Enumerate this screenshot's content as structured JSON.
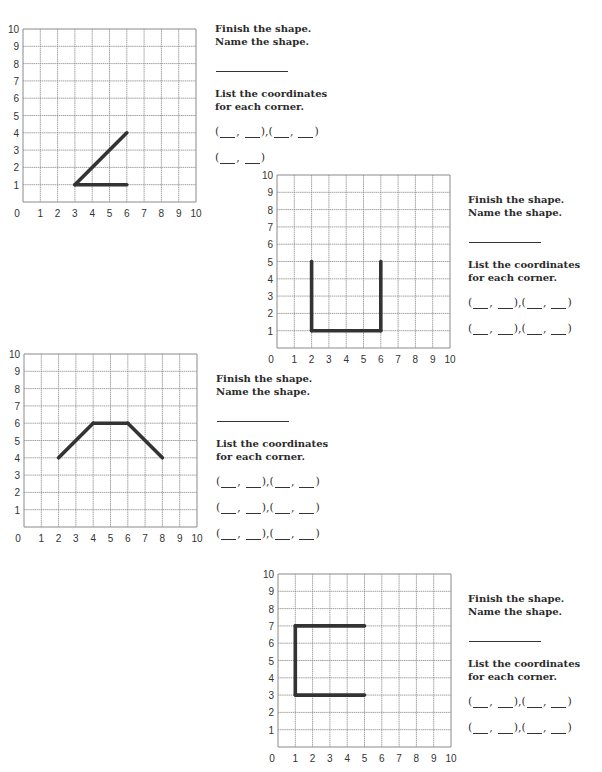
{
  "worksheet": {
    "problems": [
      {
        "id": "problem-1",
        "instructions": {
          "finish": "Finish the shape.",
          "name": "Name the shape.",
          "list_line1": "List the coordinates",
          "list_line2": "for each corner."
        },
        "coordinate_pairs_rows": [
          2,
          1
        ],
        "grid": {
          "x_ticks": [
            "0",
            "1",
            "2",
            "3",
            "4",
            "5",
            "6",
            "7",
            "8",
            "9",
            "10"
          ],
          "y_ticks": [
            "1",
            "2",
            "3",
            "4",
            "5",
            "6",
            "7",
            "8",
            "9",
            "10"
          ]
        },
        "drawn_segments": [
          [
            [
              3,
              1
            ],
            [
              6,
              4
            ]
          ],
          [
            [
              3,
              1
            ],
            [
              6,
              1
            ]
          ]
        ]
      },
      {
        "id": "problem-2",
        "instructions": {
          "finish": "Finish the shape.",
          "name": "Name the shape.",
          "list_line1": "List the coordinates",
          "list_line2": "for each corner."
        },
        "coordinate_pairs_rows": [
          2,
          2
        ],
        "grid": {
          "x_ticks": [
            "0",
            "1",
            "2",
            "3",
            "4",
            "5",
            "6",
            "7",
            "8",
            "9",
            "10"
          ],
          "y_ticks": [
            "1",
            "2",
            "3",
            "4",
            "5",
            "6",
            "7",
            "8",
            "9",
            "10"
          ]
        },
        "drawn_segments": [
          [
            [
              2,
              5
            ],
            [
              2,
              1
            ]
          ],
          [
            [
              2,
              1
            ],
            [
              6,
              1
            ]
          ],
          [
            [
              6,
              1
            ],
            [
              6,
              5
            ]
          ]
        ]
      },
      {
        "id": "problem-3",
        "instructions": {
          "finish": "Finish the shape.",
          "name": "Name the shape.",
          "list_line1": "List the coordinates",
          "list_line2": "for each corner."
        },
        "coordinate_pairs_rows": [
          2,
          2,
          2
        ],
        "grid": {
          "x_ticks": [
            "0",
            "1",
            "2",
            "3",
            "4",
            "5",
            "6",
            "7",
            "8",
            "9",
            "10"
          ],
          "y_ticks": [
            "1",
            "2",
            "3",
            "4",
            "5",
            "6",
            "7",
            "8",
            "9",
            "10"
          ]
        },
        "drawn_segments": [
          [
            [
              2,
              4
            ],
            [
              4,
              6
            ]
          ],
          [
            [
              4,
              6
            ],
            [
              6,
              6
            ]
          ],
          [
            [
              6,
              6
            ],
            [
              8,
              4
            ]
          ]
        ]
      },
      {
        "id": "problem-4",
        "instructions": {
          "finish": "Finish the shape.",
          "name": "Name the shape.",
          "list_line1": "List the coordinates",
          "list_line2": "for each corner."
        },
        "coordinate_pairs_rows": [
          2,
          2
        ],
        "grid": {
          "x_ticks": [
            "0",
            "1",
            "2",
            "3",
            "4",
            "5",
            "6",
            "7",
            "8",
            "9",
            "10"
          ],
          "y_ticks": [
            "1",
            "2",
            "3",
            "4",
            "5",
            "6",
            "7",
            "8",
            "9",
            "10"
          ]
        },
        "drawn_segments": [
          [
            [
              5,
              7
            ],
            [
              1,
              7
            ]
          ],
          [
            [
              1,
              7
            ],
            [
              1,
              3
            ]
          ],
          [
            [
              1,
              3
            ],
            [
              5,
              3
            ]
          ]
        ]
      }
    ]
  },
  "chart_data": [
    {
      "type": "line",
      "title": "Problem 1 coordinate grid",
      "xlabel": "",
      "ylabel": "",
      "xlim": [
        0,
        10
      ],
      "ylim": [
        0,
        10
      ],
      "grid": true,
      "series": [
        {
          "name": "drawn shape",
          "points": [
            [
              6,
              4
            ],
            [
              3,
              1
            ],
            [
              6,
              1
            ]
          ]
        }
      ]
    },
    {
      "type": "line",
      "title": "Problem 2 coordinate grid",
      "xlabel": "",
      "ylabel": "",
      "xlim": [
        0,
        10
      ],
      "ylim": [
        0,
        10
      ],
      "grid": true,
      "series": [
        {
          "name": "drawn shape",
          "points": [
            [
              2,
              5
            ],
            [
              2,
              1
            ],
            [
              6,
              1
            ],
            [
              6,
              5
            ]
          ]
        }
      ]
    },
    {
      "type": "line",
      "title": "Problem 3 coordinate grid",
      "xlabel": "",
      "ylabel": "",
      "xlim": [
        0,
        10
      ],
      "ylim": [
        0,
        10
      ],
      "grid": true,
      "series": [
        {
          "name": "drawn shape",
          "points": [
            [
              2,
              4
            ],
            [
              4,
              6
            ],
            [
              6,
              6
            ],
            [
              8,
              4
            ]
          ]
        }
      ]
    },
    {
      "type": "line",
      "title": "Problem 4 coordinate grid",
      "xlabel": "",
      "ylabel": "",
      "xlim": [
        0,
        10
      ],
      "ylim": [
        0,
        10
      ],
      "grid": true,
      "series": [
        {
          "name": "drawn shape",
          "points": [
            [
              5,
              7
            ],
            [
              1,
              7
            ],
            [
              1,
              3
            ],
            [
              5,
              3
            ]
          ]
        }
      ]
    }
  ],
  "colors": {
    "ink": "#2a2a2a",
    "grid": "#8a8a8a",
    "shape": "#333333",
    "paper": "#ffffff"
  }
}
